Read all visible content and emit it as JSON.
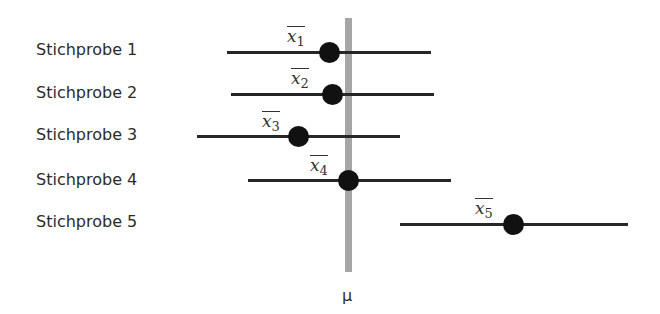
{
  "diagram": {
    "population_mean_label": "μ",
    "samples": [
      {
        "label": "Stichprobe 1",
        "mean_symbol": "x",
        "subscript": "1",
        "ci_left": 227,
        "ci_right": 431,
        "mean_x": 329,
        "y": 52
      },
      {
        "label": "Stichprobe 2",
        "mean_symbol": "x",
        "subscript": "2",
        "ci_left": 231,
        "ci_right": 434,
        "mean_x": 332,
        "y": 94
      },
      {
        "label": "Stichprobe 3",
        "mean_symbol": "x",
        "subscript": "3",
        "ci_left": 197,
        "ci_right": 400,
        "mean_x": 298,
        "y": 136
      },
      {
        "label": "Stichprobe 4",
        "mean_symbol": "x",
        "subscript": "4",
        "ci_left": 248,
        "ci_right": 451,
        "mean_x": 348,
        "y": 180
      },
      {
        "label": "Stichprobe 5",
        "mean_symbol": "x",
        "subscript": "5",
        "ci_left": 400,
        "ci_right": 628,
        "mean_x": 513,
        "y": 224
      }
    ],
    "colors": {
      "mean_bar": "#a6a6a6",
      "lines": "#262626",
      "dots": "#111111"
    }
  }
}
